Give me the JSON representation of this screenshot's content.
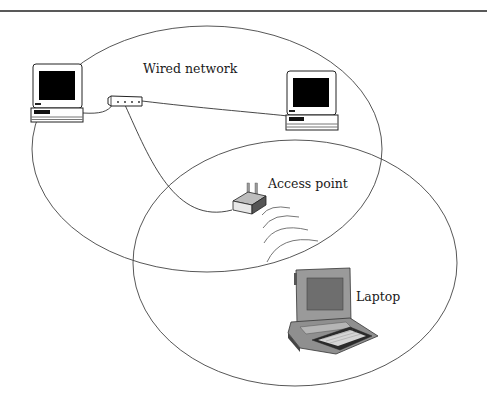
{
  "diagram": {
    "labels": {
      "wired_network": "Wired network",
      "access_point": "Access point",
      "laptop": "Laptop"
    },
    "nodes": [
      {
        "id": "desktop-left",
        "type": "desktop-computer"
      },
      {
        "id": "hub",
        "type": "network-hub"
      },
      {
        "id": "desktop-right",
        "type": "desktop-computer"
      },
      {
        "id": "access-point",
        "type": "wireless-access-point"
      },
      {
        "id": "laptop",
        "type": "laptop-computer"
      }
    ],
    "regions": [
      {
        "id": "wired-coverage",
        "shape": "ellipse"
      },
      {
        "id": "wireless-coverage",
        "shape": "ellipse"
      }
    ],
    "links": [
      {
        "from": "desktop-left",
        "to": "hub",
        "kind": "wired"
      },
      {
        "from": "hub",
        "to": "desktop-right",
        "kind": "wired"
      },
      {
        "from": "hub",
        "to": "access-point",
        "kind": "wired"
      },
      {
        "from": "access-point",
        "to": "laptop",
        "kind": "wireless"
      }
    ],
    "colors": {
      "line": "#333333",
      "screen": "#000000",
      "laptop_body": "#8a8a8a"
    }
  }
}
